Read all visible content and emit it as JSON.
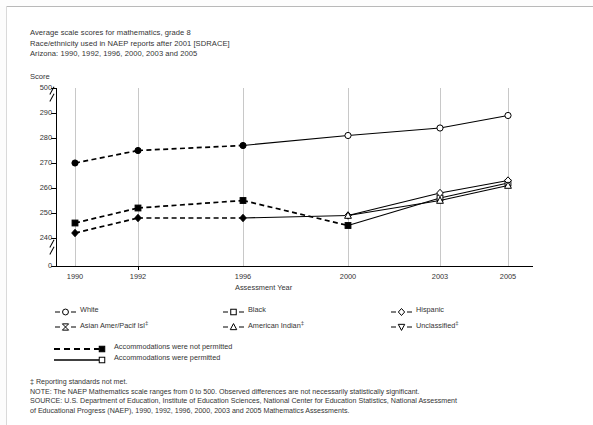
{
  "title": {
    "line1": "Average scale scores for mathematics, grade 8",
    "line2": "Race/ethnicity used in NAEP reports after 2001 [SDRACE]",
    "line3": "Arizona: 1990, 1992, 1996, 2000, 2003 and 2005"
  },
  "axis": {
    "y_label": "Score",
    "x_label": "Assessment Year",
    "y_ticks": [
      "500",
      "290",
      "280",
      "270",
      "260",
      "250",
      "240",
      "0"
    ]
  },
  "legend": {
    "items": [
      {
        "label": "White",
        "marker": "circle-icon",
        "dagger": ""
      },
      {
        "label": "Black",
        "marker": "square-icon",
        "dagger": ""
      },
      {
        "label": "Hispanic",
        "marker": "diamond-icon",
        "dagger": ""
      },
      {
        "label": "Asian Amer/Pacif Isl",
        "marker": "bowtie-icon",
        "dagger": "‡"
      },
      {
        "label": "American Indian",
        "marker": "triangle-up-icon",
        "dagger": "‡"
      },
      {
        "label": "Unclassified",
        "marker": "triangle-down-icon",
        "dagger": "‡"
      }
    ],
    "accommodations": [
      {
        "label": "Accommodations were not permitted",
        "style": "dashed-filled"
      },
      {
        "label": "Accommodations were permitted",
        "style": "solid-open"
      }
    ]
  },
  "notes": {
    "footnote": "‡ Reporting standards not met.",
    "note": "NOTE: The NAEP Mathematics scale ranges from 0 to 500. Observed differences are not necessarily statistically significant.",
    "source1": "SOURCE: U.S. Department of Education, Institute of Education Sciences, National Center for Education Statistics, National Assessment",
    "source2": "of Educational Progress (NAEP), 1990, 1992, 1996, 2000, 2003 and 2005 Mathematics Assessments."
  },
  "chart_data": {
    "type": "line",
    "xlabel": "Assessment Year",
    "ylabel": "Score",
    "x": [
      "1990",
      "1992",
      "1996",
      "2000",
      "2003",
      "2005"
    ],
    "ylim": [
      240,
      290
    ],
    "y_axis_full_range": [
      0,
      500
    ],
    "axis_breaks": [
      "between 0 and 240",
      "between 290 and 500"
    ],
    "grid": "vertical",
    "legend_position": "below-plot",
    "series": [
      {
        "name": "White",
        "marker": "circle",
        "values": [
          270,
          275,
          277,
          281,
          284,
          289
        ],
        "accommodations_not_permitted": [
          1990,
          1992,
          1996
        ],
        "accommodations_permitted": [
          2000,
          2003,
          2005
        ]
      },
      {
        "name": "Black",
        "marker": "square",
        "values": [
          246,
          252,
          255,
          245,
          256,
          262
        ],
        "accommodations_not_permitted": [
          1990,
          1992,
          1996,
          2000
        ],
        "accommodations_permitted": [
          2000,
          2003,
          2005
        ]
      },
      {
        "name": "Hispanic",
        "marker": "diamond",
        "values": [
          242,
          248,
          248,
          249,
          258,
          263
        ],
        "accommodations_not_permitted": [
          1990,
          1992,
          1996
        ],
        "accommodations_permitted": [
          2000,
          2003,
          2005
        ]
      },
      {
        "name": "American Indian",
        "marker": "triangle-up",
        "values": [
          null,
          null,
          null,
          249,
          255,
          261
        ],
        "accommodations_permitted": [
          2000,
          2003,
          2005
        ],
        "reporting_standards_not_met": true
      }
    ]
  }
}
